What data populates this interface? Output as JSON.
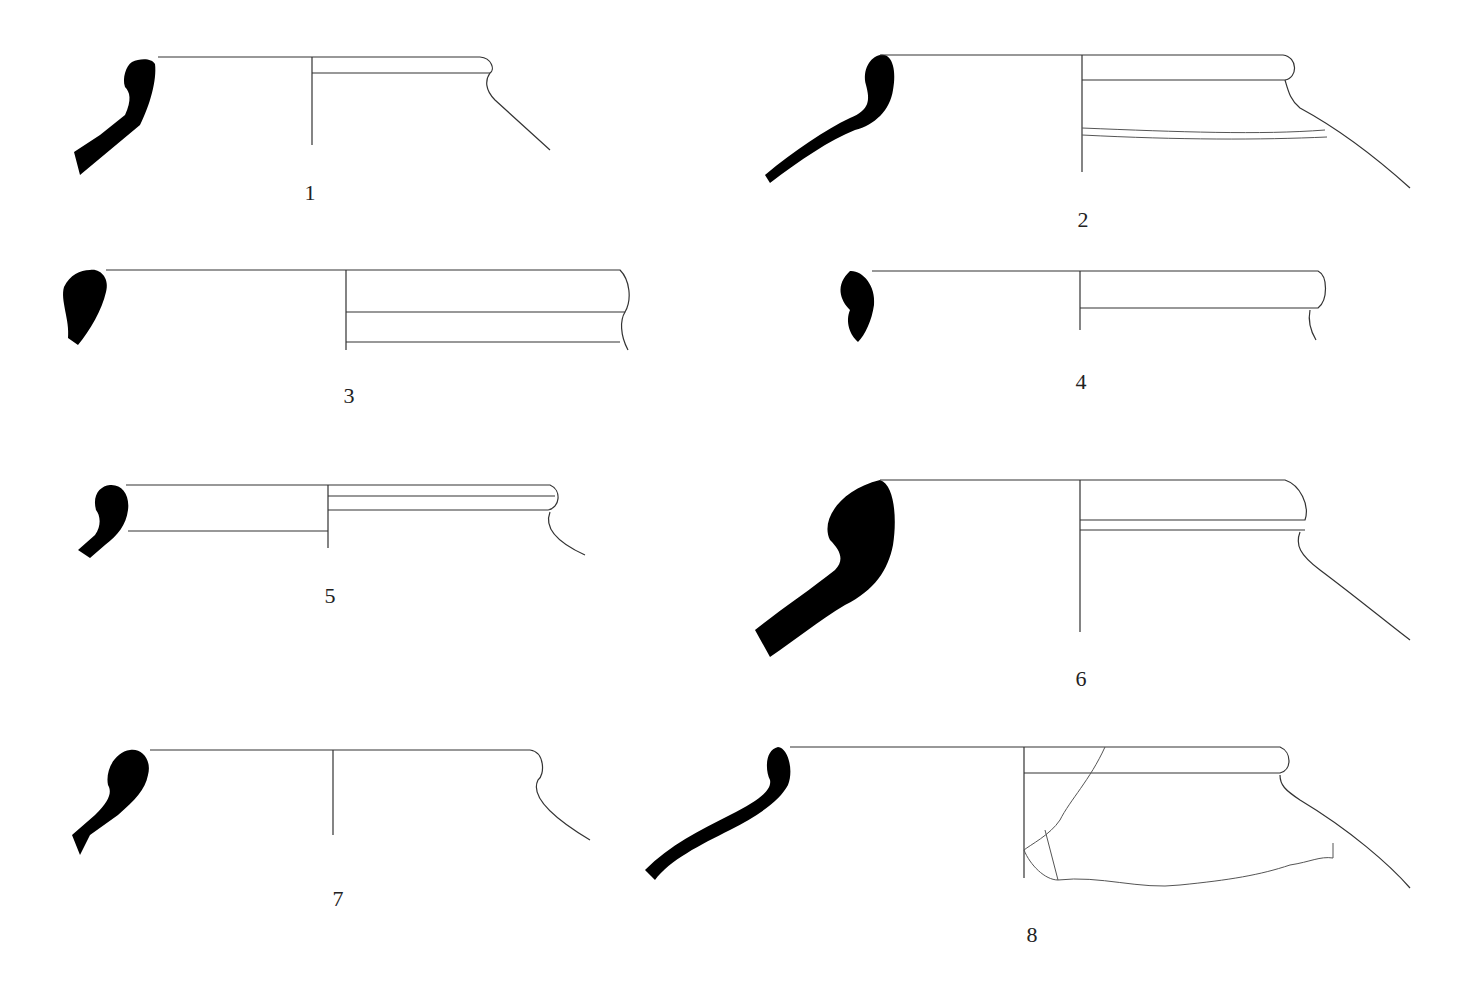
{
  "figure": {
    "type": "pottery rim profile drawings",
    "vessels": [
      {
        "id": "1",
        "label": "1"
      },
      {
        "id": "2",
        "label": "2"
      },
      {
        "id": "3",
        "label": "3"
      },
      {
        "id": "4",
        "label": "4"
      },
      {
        "id": "5",
        "label": "5"
      },
      {
        "id": "6",
        "label": "6"
      },
      {
        "id": "7",
        "label": "7"
      },
      {
        "id": "8",
        "label": "8"
      }
    ],
    "colors": {
      "section_fill": "#000000",
      "line": "#333333",
      "background": "#ffffff"
    }
  }
}
